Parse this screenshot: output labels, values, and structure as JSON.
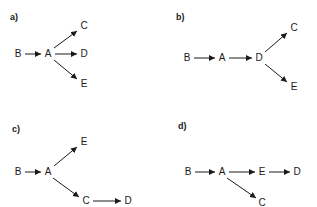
{
  "figure": {
    "background_color": "#ffffff",
    "ink_color": "#1a1a1a",
    "width": 317,
    "height": 207
  },
  "panels": [
    {
      "id": "a",
      "label": "a)",
      "label_x": 10,
      "label_y": 13,
      "nodes": [
        {
          "id": "B",
          "label": "B",
          "x": 18,
          "y": 54
        },
        {
          "id": "A",
          "label": "A",
          "x": 48,
          "y": 54
        },
        {
          "id": "C",
          "label": "C",
          "x": 84,
          "y": 26
        },
        {
          "id": "D",
          "label": "D",
          "x": 84,
          "y": 54
        },
        {
          "id": "E",
          "label": "E",
          "x": 84,
          "y": 84
        }
      ],
      "edges": [
        {
          "from": "B",
          "to": "A",
          "x1": 25,
          "y1": 54,
          "x2": 41,
          "y2": 54
        },
        {
          "from": "A",
          "to": "C",
          "x1": 54,
          "y1": 48,
          "x2": 77,
          "y2": 31
        },
        {
          "from": "A",
          "to": "D",
          "x1": 55,
          "y1": 54,
          "x2": 77,
          "y2": 54
        },
        {
          "from": "A",
          "to": "E",
          "x1": 54,
          "y1": 60,
          "x2": 77,
          "y2": 79
        }
      ]
    },
    {
      "id": "b",
      "label": "b)",
      "label_x": 17,
      "label_y": 13,
      "nodes": [
        {
          "id": "B",
          "label": "B",
          "x": 28,
          "y": 58
        },
        {
          "id": "A",
          "label": "A",
          "x": 63,
          "y": 58
        },
        {
          "id": "D",
          "label": "D",
          "x": 100,
          "y": 58
        },
        {
          "id": "C",
          "label": "C",
          "x": 135,
          "y": 28
        },
        {
          "id": "E",
          "label": "E",
          "x": 135,
          "y": 87
        }
      ],
      "edges": [
        {
          "from": "B",
          "to": "A",
          "x1": 35,
          "y1": 58,
          "x2": 56,
          "y2": 58
        },
        {
          "from": "A",
          "to": "D",
          "x1": 70,
          "y1": 58,
          "x2": 93,
          "y2": 58
        },
        {
          "from": "D",
          "to": "C",
          "x1": 106,
          "y1": 52,
          "x2": 128,
          "y2": 33
        },
        {
          "from": "D",
          "to": "E",
          "x1": 106,
          "y1": 64,
          "x2": 128,
          "y2": 82
        }
      ]
    },
    {
      "id": "c",
      "label": "c)",
      "label_x": 12,
      "label_y": 21,
      "nodes": [
        {
          "id": "B",
          "label": "B",
          "x": 18,
          "y": 68
        },
        {
          "id": "A",
          "label": "A",
          "x": 48,
          "y": 68
        },
        {
          "id": "E",
          "label": "E",
          "x": 84,
          "y": 38
        },
        {
          "id": "C",
          "label": "C",
          "x": 86,
          "y": 97
        },
        {
          "id": "D",
          "label": "D",
          "x": 128,
          "y": 97
        }
      ],
      "edges": [
        {
          "from": "B",
          "to": "A",
          "x1": 25,
          "y1": 68,
          "x2": 41,
          "y2": 68
        },
        {
          "from": "A",
          "to": "E",
          "x1": 54,
          "y1": 62,
          "x2": 77,
          "y2": 43
        },
        {
          "from": "A",
          "to": "C",
          "x1": 53,
          "y1": 74,
          "x2": 79,
          "y2": 93
        },
        {
          "from": "C",
          "to": "D",
          "x1": 93,
          "y1": 97,
          "x2": 121,
          "y2": 97
        }
      ]
    },
    {
      "id": "d",
      "label": "d)",
      "label_x": 19,
      "label_y": 18,
      "nodes": [
        {
          "id": "B",
          "label": "B",
          "x": 29,
          "y": 68
        },
        {
          "id": "A",
          "label": "A",
          "x": 63,
          "y": 68
        },
        {
          "id": "E",
          "label": "E",
          "x": 103,
          "y": 68
        },
        {
          "id": "D",
          "label": "D",
          "x": 138,
          "y": 68
        },
        {
          "id": "C",
          "label": "C",
          "x": 103,
          "y": 99
        }
      ],
      "edges": [
        {
          "from": "B",
          "to": "A",
          "x1": 36,
          "y1": 68,
          "x2": 56,
          "y2": 68
        },
        {
          "from": "A",
          "to": "E",
          "x1": 70,
          "y1": 68,
          "x2": 96,
          "y2": 68
        },
        {
          "from": "E",
          "to": "D",
          "x1": 110,
          "y1": 68,
          "x2": 131,
          "y2": 68
        },
        {
          "from": "A",
          "to": "C",
          "x1": 68,
          "y1": 74,
          "x2": 97,
          "y2": 94
        }
      ]
    }
  ]
}
